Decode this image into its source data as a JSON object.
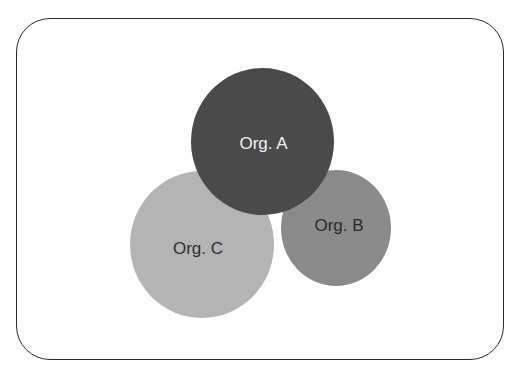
{
  "diagram": {
    "type": "overlapping-circles",
    "nodes": [
      {
        "id": "org-c",
        "label": "Org. C",
        "color": "#b4b4b4",
        "text_color": "#2e2e2e"
      },
      {
        "id": "org-b",
        "label": "Org. B",
        "color": "#8a8a8a",
        "text_color": "#2a2a2a"
      },
      {
        "id": "org-a",
        "label": "Org. A",
        "color": "#4a4a4a",
        "text_color": "#f0f0f0"
      }
    ]
  }
}
